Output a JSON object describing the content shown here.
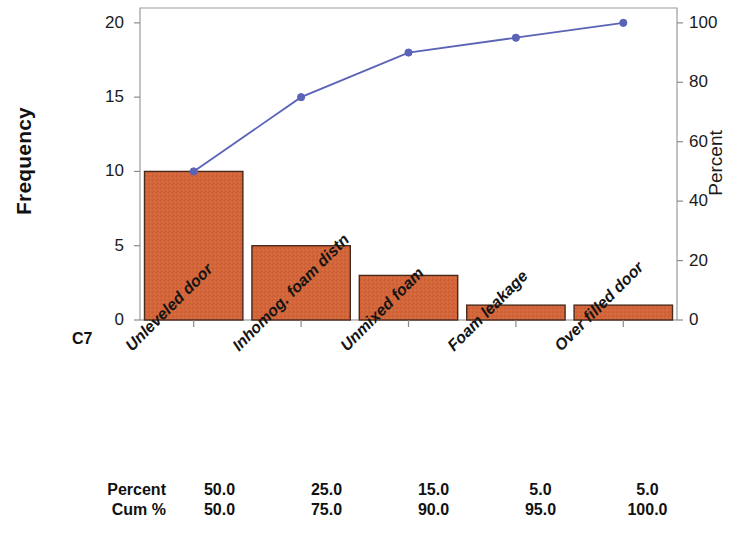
{
  "chart_data": {
    "type": "bar",
    "title": "",
    "subtitle": "",
    "xlabel": "C7",
    "ylabel": "Frequency",
    "y2label": "Percent",
    "categories": [
      "Unleveled door",
      "Inhomog. foam distn",
      "Unmixed foam",
      "Foam leakage",
      "Over filled door"
    ],
    "values": [
      10,
      5,
      3,
      1,
      1
    ],
    "ylim": [
      0,
      21
    ],
    "yticks": [
      "0",
      "5",
      "10",
      "15",
      "20"
    ],
    "ytick_values": [
      0,
      5,
      10,
      15,
      20
    ],
    "y2lim": [
      0,
      105
    ],
    "y2ticks": [
      "0",
      "20",
      "40",
      "60",
      "80",
      "100"
    ],
    "y2tick_values": [
      0,
      20,
      40,
      60,
      80,
      100
    ],
    "grid": false,
    "legend": "none",
    "series": [
      {
        "name": "Frequency",
        "type": "bar",
        "values": [
          10,
          5,
          3,
          1,
          1
        ]
      },
      {
        "name": "Cum %",
        "type": "line",
        "values": [
          50.0,
          75.0,
          90.0,
          95.0,
          100.0
        ]
      }
    ],
    "bar_color": "#d2653a",
    "bar_edge_color": "#4a2a1c",
    "line_color": "#5b63b7",
    "marker_color": "#5b63b7",
    "frame_color": "#9b9b9b"
  },
  "table": {
    "rows": [
      {
        "label": "Percent",
        "values": [
          "50.0",
          "25.0",
          "15.0",
          "5.0",
          "5.0"
        ]
      },
      {
        "label": "Cum %",
        "values": [
          "50.0",
          "75.0",
          "90.0",
          "95.0",
          "100.0"
        ]
      }
    ]
  }
}
